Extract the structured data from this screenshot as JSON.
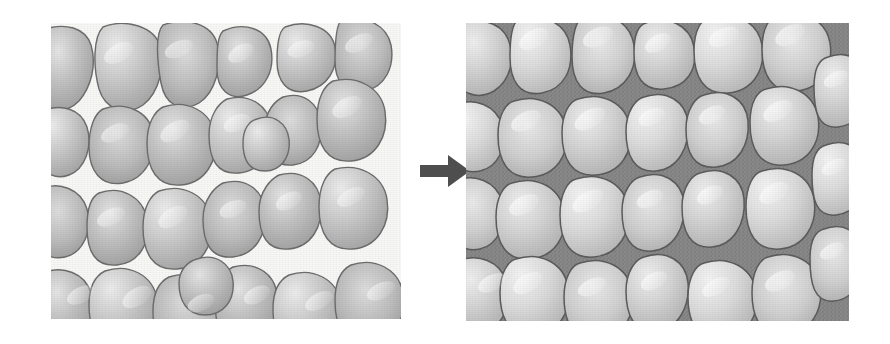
{
  "figure": {
    "background_color": "#ffffff",
    "width": 890,
    "height": 344
  },
  "panels": [
    {
      "id": "before",
      "label": "Loose sediment grains with open pore space",
      "pore_description": "white open pore space between grains",
      "grain_fill_color": "#b4b4b4",
      "grain_outline_color": "#6b6b6b",
      "pore_color": "#f7f7f5",
      "grain_count": 33,
      "bounds": {
        "x": 51,
        "y": 23,
        "width": 350,
        "height": 296
      }
    },
    {
      "id": "after",
      "label": "Cemented grains with pore space filled by cement",
      "pore_description": "dark grey cement filling the pore space",
      "grain_fill_color": "#d3d3d3",
      "grain_outline_color": "#5a5a5a",
      "pore_color": "#8a8a8a",
      "grain_count": 33,
      "bounds": {
        "x": 466,
        "y": 23,
        "width": 383,
        "height": 298
      }
    }
  ],
  "arrow": {
    "name": "process-arrow",
    "direction": "right",
    "color": "#4e4e4e",
    "bounds": {
      "x": 414,
      "y": 148,
      "width": 60,
      "height": 46
    }
  },
  "colors": {
    "page_background": "#ffffff",
    "grain_light": "#e2e2e2",
    "grain_mid": "#b9b9b9",
    "grain_dark": "#8f8f8f",
    "outline": "#6b6b6b",
    "cement": "#8a8a8a",
    "arrow": "#4e4e4e"
  }
}
